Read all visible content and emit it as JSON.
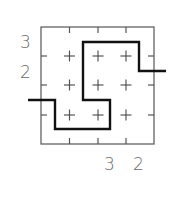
{
  "puzzle": {
    "grid_size": 4,
    "row_clues": [
      {
        "row": 1,
        "value": "3"
      },
      {
        "row": 2,
        "value": "2"
      }
    ],
    "col_clues": [
      {
        "col": 3,
        "value": "3"
      },
      {
        "col": 4,
        "value": "2"
      }
    ],
    "path_color": "#111111",
    "grid_color": "#555555",
    "clue_color": "#6a6a6a"
  }
}
